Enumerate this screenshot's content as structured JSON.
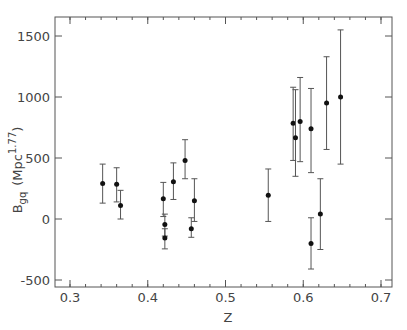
{
  "chart_data": {
    "type": "scatter",
    "title": "",
    "xlabel": "Z",
    "ylabel": "B_gq (Mpc^1.77)",
    "ylabel_main": "B",
    "ylabel_sub": "gq",
    "ylabel_unit": "(Mpc",
    "ylabel_exp": "1.77",
    "ylabel_close": ")",
    "xlim": [
      0.28,
      0.72
    ],
    "ylim": [
      -550,
      1620
    ],
    "xticks": [
      0.3,
      0.4,
      0.5,
      0.6,
      0.7
    ],
    "xtick_labels": [
      "0.3",
      "0.4",
      "0.5",
      "0.6",
      "0.7"
    ],
    "yticks": [
      -500,
      0,
      500,
      1000,
      1500
    ],
    "ytick_labels": [
      "-500",
      "0",
      "500",
      "1000",
      "1500"
    ],
    "grid": false,
    "legend": null,
    "error_bars": true,
    "points": [
      {
        "x": 0.342,
        "y": 290,
        "ylo": 130,
        "yhi": 450
      },
      {
        "x": 0.36,
        "y": 285,
        "ylo": 140,
        "yhi": 420
      },
      {
        "x": 0.365,
        "y": 110,
        "ylo": 0,
        "yhi": 235
      },
      {
        "x": 0.42,
        "y": 165,
        "ylo": 20,
        "yhi": 300
      },
      {
        "x": 0.422,
        "y": -45,
        "ylo": -140,
        "yhi": 40
      },
      {
        "x": 0.422,
        "y": -155,
        "ylo": -245,
        "yhi": -80
      },
      {
        "x": 0.433,
        "y": 305,
        "ylo": 160,
        "yhi": 460
      },
      {
        "x": 0.448,
        "y": 480,
        "ylo": 330,
        "yhi": 650
      },
      {
        "x": 0.456,
        "y": -80,
        "ylo": -150,
        "yhi": 10
      },
      {
        "x": 0.46,
        "y": 150,
        "ylo": -20,
        "yhi": 330
      },
      {
        "x": 0.555,
        "y": 195,
        "ylo": -20,
        "yhi": 410
      },
      {
        "x": 0.587,
        "y": 785,
        "ylo": 480,
        "yhi": 1080
      },
      {
        "x": 0.59,
        "y": 665,
        "ylo": 350,
        "yhi": 1060
      },
      {
        "x": 0.596,
        "y": 800,
        "ylo": 470,
        "yhi": 1160
      },
      {
        "x": 0.61,
        "y": 740,
        "ylo": 380,
        "yhi": 1070
      },
      {
        "x": 0.61,
        "y": -200,
        "ylo": -410,
        "yhi": 10
      },
      {
        "x": 0.622,
        "y": 40,
        "ylo": -250,
        "yhi": 330
      },
      {
        "x": 0.63,
        "y": 950,
        "ylo": 570,
        "yhi": 1330
      },
      {
        "x": 0.648,
        "y": 1000,
        "ylo": 450,
        "yhi": 1550
      }
    ]
  },
  "colors": {
    "axis": "#555555",
    "marker": "#111111",
    "errorbar": "#555555",
    "text": "#444444"
  }
}
